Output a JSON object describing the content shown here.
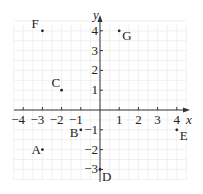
{
  "chart_data": {
    "type": "scatter",
    "title": "",
    "xlabel": "x",
    "ylabel": "y",
    "xlim": [
      -4.5,
      4.5
    ],
    "ylim": [
      -3.5,
      4.5
    ],
    "grid": true,
    "x_ticks": [
      -4,
      -3,
      -2,
      -1,
      1,
      2,
      3,
      4
    ],
    "x_tick_labels": [
      "−4",
      "−3",
      "−2",
      "−1",
      "1",
      "2",
      "3",
      "4"
    ],
    "y_ticks": [
      4,
      3,
      2,
      1,
      -1,
      -2,
      -3
    ],
    "y_tick_labels": [
      "4",
      "3",
      "2",
      "1",
      "−1",
      "−2",
      "−3"
    ],
    "points": [
      {
        "label": "A",
        "x": -3,
        "y": -2
      },
      {
        "label": "B",
        "x": -1,
        "y": -1
      },
      {
        "label": "C",
        "x": -2,
        "y": 1
      },
      {
        "label": "D",
        "x": 0,
        "y": -3
      },
      {
        "label": "E",
        "x": 4,
        "y": -1
      },
      {
        "label": "F",
        "x": -3,
        "y": 4
      },
      {
        "label": "G",
        "x": 1,
        "y": 4
      }
    ]
  },
  "colors": {
    "axis": "#333333",
    "grid": "#ececec",
    "point": "#222222"
  }
}
